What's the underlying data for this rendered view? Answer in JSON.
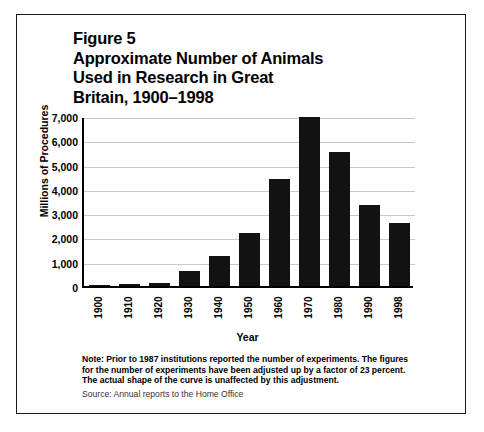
{
  "figure": {
    "title_lines": [
      "Figure 5",
      "Approximate Number of Animals",
      "Used in Research in Great",
      "Britain, 1900–1998"
    ],
    "note": "Note: Prior to 1987 institutions reported the number of experiments. The figures for the number of experiments have been adjusted up by a factor of 23 percent. The actual shape of the curve is unaffected by this adjustment.",
    "source": "Source: Annual reports to the Home Office",
    "frame_color": "#1a1a1a"
  },
  "chart_data": {
    "type": "bar",
    "title": "Approximate Number of Animals Used in Research in Great Britain, 1900–1998",
    "xlabel": "Year",
    "ylabel": "Millions of Procedures",
    "categories": [
      "1900",
      "1910",
      "1920",
      "1930",
      "1940",
      "1950",
      "1960",
      "1970",
      "1980",
      "1990",
      "1998"
    ],
    "values": [
      20,
      100,
      120,
      600,
      1250,
      2200,
      4400,
      6950,
      5500,
      3350,
      2600
    ],
    "ylim": [
      0,
      7000
    ],
    "yticks": [
      0,
      1000,
      2000,
      3000,
      4000,
      5000,
      6000,
      7000
    ],
    "ytick_labels": [
      "0",
      "1,000",
      "2,000",
      "3,000",
      "4,000",
      "5,000",
      "6,000",
      "7,000"
    ],
    "grid": true,
    "legend": false,
    "bar_color": "#121212",
    "grid_color": "#c9c9c9"
  }
}
